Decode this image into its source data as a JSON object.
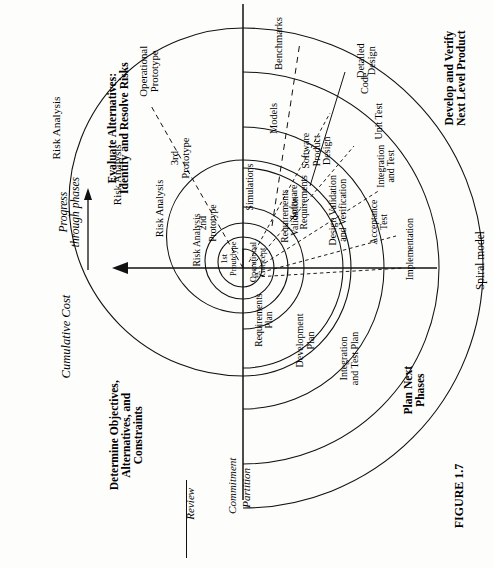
{
  "figure": {
    "number": "FIGURE 1.7",
    "caption": "Spiral model"
  },
  "axes": {
    "cost_label": "Cumulative Cost",
    "progress_label_line1": "Progress",
    "progress_label_line2": "through phases"
  },
  "baseline": {
    "review": "Review",
    "commitment": "Commitment",
    "partition": "Partition"
  },
  "quadrants": {
    "determine": "Determine Objectives,\nAlternatives, and\nConstraints",
    "evaluate": "Evaluate Alternatives:\nIdentify and Resolve Risks",
    "develop": "Develop and Verify\nNext Level Product",
    "plan": "Plan Next\nPhases"
  },
  "risk_analysis": {
    "pass1": "Risk Analysis",
    "pass2": "Risk Analysis",
    "pass3": "Risk Analysis",
    "pass4": "Risk Analysis"
  },
  "prototypes": {
    "p1": "1st\nProutdype",
    "p2": "2nd\nPrototype",
    "p3": "3rd\nPrototype",
    "p4": "Operational\nPrototype"
  },
  "evaluate_items": {
    "operational_concept": "Operational\nConcept",
    "simulations": "Simulations",
    "models": "Models",
    "benchmarks": "Benchmarks"
  },
  "develop_items": {
    "software_requirements": "Software\nRequirements",
    "software_product_design": "Software\nProduct\nDesign",
    "detailed_design": "Detailed\nDesign",
    "code": "Code",
    "unit_test": "Unit Test",
    "integration_and_test": "Integration\nand Test",
    "acceptance_test": "Acceptance\nTest",
    "implementation": "Implementation",
    "requirements_validation": "Requirements\nValidation",
    "design_validation": "Design Validation\nand Verification"
  },
  "plan_items": {
    "requirements_plan": "Requirements\nPlan",
    "development_plan": "Development\nPlan",
    "integration_and_test_plan": "Integration\nand Test Plan"
  },
  "colors": {
    "ink": "#000000",
    "paper": "#fdfdfb"
  },
  "geometry": {
    "center_x": 243,
    "center_y": 268,
    "arc_radii": [
      30,
      62,
      100,
      141,
      196
    ]
  }
}
